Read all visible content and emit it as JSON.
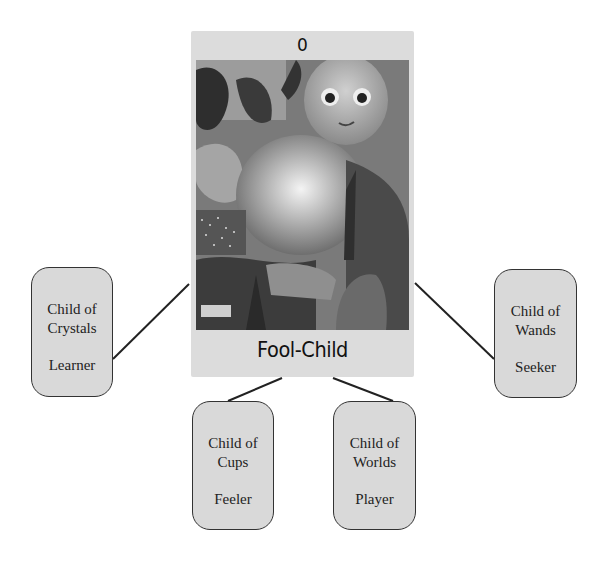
{
  "card": {
    "number": "0",
    "title": "Fool-Child",
    "art_description": "collage: doll-faced child, glowing orb, foliage, hands reaching"
  },
  "nodes": [
    {
      "id": "crystals",
      "name_line1": "Child of",
      "name_line2": "Crystals",
      "role": "Learner"
    },
    {
      "id": "cups",
      "name_line1": "Child of",
      "name_line2": "Cups",
      "role": "Feeler"
    },
    {
      "id": "worlds",
      "name_line1": "Child of",
      "name_line2": "Worlds",
      "role": "Player"
    },
    {
      "id": "wands",
      "name_line1": "Child of",
      "name_line2": "Wands",
      "role": "Seeker"
    }
  ],
  "colors": {
    "node_fill": "#d9d9d9",
    "card_fill": "#dcdcdc",
    "line": "#222222"
  }
}
